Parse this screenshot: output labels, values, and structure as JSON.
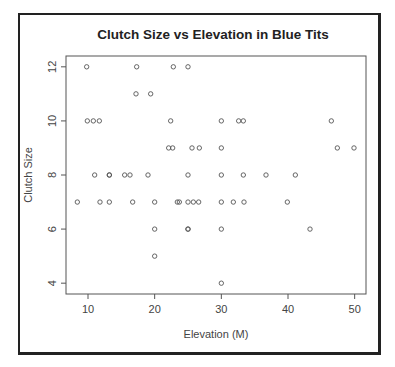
{
  "chart_data": {
    "type": "scatter",
    "title": "Clutch Size vs Elevation in Blue Tits",
    "xlabel": "Elevation (M)",
    "ylabel": "Clutch Size",
    "xlim": [
      6.7,
      51.7
    ],
    "ylim": [
      3.6,
      12.4
    ],
    "xticks": [
      10,
      20,
      30,
      40,
      50
    ],
    "yticks": [
      4,
      6,
      8,
      10,
      12
    ],
    "grid": false,
    "legend": "none",
    "marker": "open-circle",
    "points": [
      {
        "x": 9.8,
        "y": 12
      },
      {
        "x": 17.3,
        "y": 12
      },
      {
        "x": 22.8,
        "y": 12
      },
      {
        "x": 25.0,
        "y": 12
      },
      {
        "x": 17.2,
        "y": 11
      },
      {
        "x": 19.4,
        "y": 11
      },
      {
        "x": 9.9,
        "y": 10
      },
      {
        "x": 10.8,
        "y": 10
      },
      {
        "x": 11.7,
        "y": 10
      },
      {
        "x": 22.4,
        "y": 10
      },
      {
        "x": 30.0,
        "y": 10
      },
      {
        "x": 32.6,
        "y": 10
      },
      {
        "x": 33.3,
        "y": 10
      },
      {
        "x": 46.5,
        "y": 10
      },
      {
        "x": 22.1,
        "y": 9
      },
      {
        "x": 22.7,
        "y": 9
      },
      {
        "x": 25.6,
        "y": 9
      },
      {
        "x": 26.7,
        "y": 9
      },
      {
        "x": 30.0,
        "y": 9
      },
      {
        "x": 47.4,
        "y": 9
      },
      {
        "x": 49.9,
        "y": 9
      },
      {
        "x": 11.0,
        "y": 8
      },
      {
        "x": 13.2,
        "y": 8
      },
      {
        "x": 13.2,
        "y": 8
      },
      {
        "x": 15.5,
        "y": 8
      },
      {
        "x": 16.3,
        "y": 8
      },
      {
        "x": 19.0,
        "y": 8
      },
      {
        "x": 25.0,
        "y": 8
      },
      {
        "x": 30.0,
        "y": 8
      },
      {
        "x": 33.3,
        "y": 8
      },
      {
        "x": 36.7,
        "y": 8
      },
      {
        "x": 41.1,
        "y": 8
      },
      {
        "x": 8.4,
        "y": 7
      },
      {
        "x": 11.8,
        "y": 7
      },
      {
        "x": 13.2,
        "y": 7
      },
      {
        "x": 16.7,
        "y": 7
      },
      {
        "x": 20.0,
        "y": 7
      },
      {
        "x": 23.4,
        "y": 7
      },
      {
        "x": 23.7,
        "y": 7
      },
      {
        "x": 25.0,
        "y": 7
      },
      {
        "x": 25.8,
        "y": 7
      },
      {
        "x": 26.6,
        "y": 7
      },
      {
        "x": 30.0,
        "y": 7
      },
      {
        "x": 31.8,
        "y": 7
      },
      {
        "x": 33.4,
        "y": 7
      },
      {
        "x": 39.9,
        "y": 7
      },
      {
        "x": 20.0,
        "y": 6
      },
      {
        "x": 25.0,
        "y": 6
      },
      {
        "x": 25.0,
        "y": 6
      },
      {
        "x": 30.0,
        "y": 6
      },
      {
        "x": 43.3,
        "y": 6
      },
      {
        "x": 20.0,
        "y": 5
      },
      {
        "x": 30.0,
        "y": 4
      }
    ]
  },
  "colors": {
    "frame": "#222222",
    "axis": "#555555",
    "marker": "#555555",
    "text": "#444444",
    "title": "#222222"
  }
}
